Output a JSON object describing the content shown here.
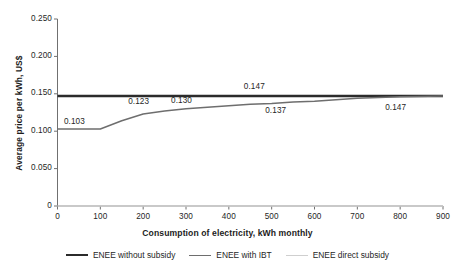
{
  "chart_data": {
    "type": "line",
    "title": "",
    "xlabel": "Consumption of electricity, kWh monthly",
    "ylabel": "Average price per kWh, US$",
    "xlim": [
      0,
      900
    ],
    "ylim": [
      0,
      0.25
    ],
    "xticks": [
      "0",
      "100",
      "200",
      "300",
      "400",
      "500",
      "600",
      "700",
      "800",
      "900"
    ],
    "yticks": [
      "0.250",
      "0.200",
      "0.150",
      "0.100",
      "0.050",
      "0"
    ],
    "grid": false,
    "legend_position": "bottom",
    "series": [
      {
        "name": "ENEE without subsidy",
        "color": "#2b2b2b",
        "x": [
          0,
          100,
          200,
          300,
          400,
          500,
          600,
          700,
          800,
          900
        ],
        "values": [
          0.147,
          0.147,
          0.147,
          0.147,
          0.147,
          0.147,
          0.147,
          0.147,
          0.147,
          0.147
        ]
      },
      {
        "name": "ENEE with IBT",
        "color": "#6e6e6e",
        "x": [
          0,
          100,
          150,
          200,
          250,
          300,
          350,
          400,
          450,
          500,
          550,
          600,
          650,
          700,
          800,
          900
        ],
        "values": [
          0.103,
          0.103,
          0.114,
          0.123,
          0.127,
          0.13,
          0.132,
          0.134,
          0.136,
          0.137,
          0.139,
          0.14,
          0.142,
          0.144,
          0.146,
          0.147
        ]
      },
      {
        "name": "ENEE direct subsidy",
        "color": "#cfcfcf",
        "x": [
          0,
          900
        ],
        "values": [
          0.0,
          0.0
        ]
      }
    ],
    "annotations": [
      {
        "text": "0.103",
        "x": 50,
        "y": 0.112
      },
      {
        "text": "0.123",
        "x": 200,
        "y": 0.139
      },
      {
        "text": "0.130",
        "x": 300,
        "y": 0.14
      },
      {
        "text": "0.147",
        "x": 470,
        "y": 0.158
      },
      {
        "text": "0.137",
        "x": 520,
        "y": 0.127
      },
      {
        "text": "0.147",
        "x": 800,
        "y": 0.131
      }
    ]
  },
  "legend": {
    "items": [
      {
        "label": "ENEE without subsidy"
      },
      {
        "label": "ENEE with IBT"
      },
      {
        "label": "ENEE direct subsidy"
      }
    ]
  }
}
